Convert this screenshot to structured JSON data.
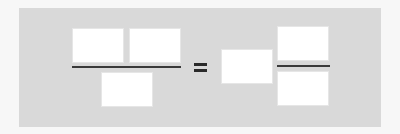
{
  "diagram": {
    "colors": {
      "page_background": "#f7f7f7",
      "panel_background": "#d9d9d9",
      "box_fill": "#ffffff",
      "line_color": "#3a3a3a"
    },
    "left_fraction": {
      "numerator_boxes": [
        "",
        ""
      ],
      "denominator_boxes": [
        ""
      ]
    },
    "operator": "=",
    "right_side": {
      "whole_number_box": "",
      "fraction": {
        "numerator_box": "",
        "denominator_box": ""
      }
    }
  }
}
